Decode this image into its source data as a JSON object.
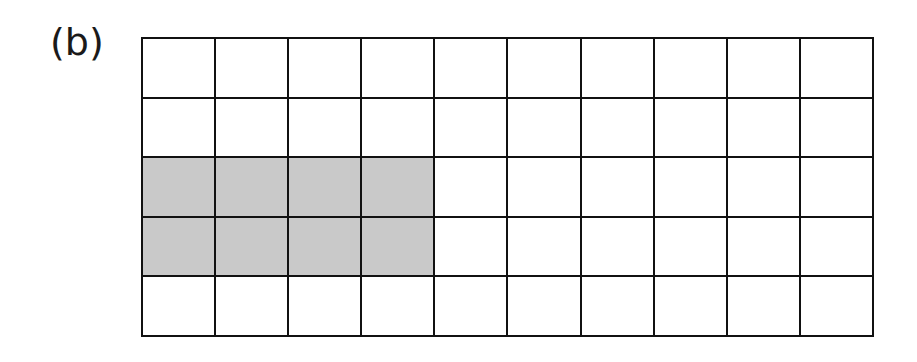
{
  "figure": {
    "label": "(b)",
    "grid": {
      "rows": 5,
      "columns": 10,
      "shaded_color": "#c9c9c9",
      "unshaded_color": "#ffffff",
      "line_color": "#111111",
      "shaded_cells": [
        [
          2,
          0
        ],
        [
          2,
          1
        ],
        [
          2,
          2
        ],
        [
          2,
          3
        ],
        [
          3,
          0
        ],
        [
          3,
          1
        ],
        [
          3,
          2
        ],
        [
          3,
          3
        ]
      ],
      "shaded_count": 8,
      "total_count": 50
    }
  }
}
